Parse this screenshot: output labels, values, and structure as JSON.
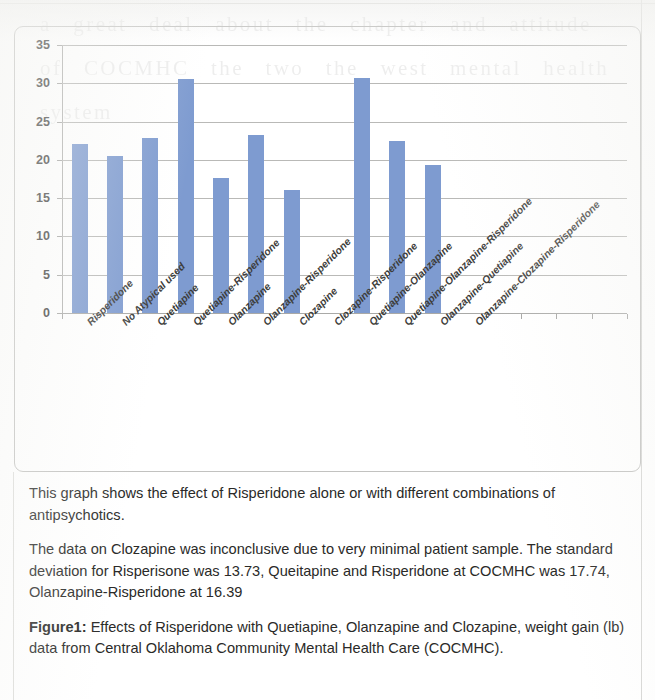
{
  "figure": {
    "frame_visible": true,
    "accent_color": "#7e9bd0",
    "grid_color": "#b9b9b7",
    "axis_color": "#a5a5a3"
  },
  "chart_data": {
    "type": "bar",
    "title": "",
    "xlabel": "",
    "ylabel": "",
    "ylim": [
      0,
      35
    ],
    "ytick_step": 5,
    "yticks": [
      0,
      5,
      10,
      15,
      20,
      25,
      30,
      35
    ],
    "grid": true,
    "legend": "none",
    "bar_color": "#7e9bd0",
    "total_category_slots": 16,
    "categories": [
      "Risperidone",
      "No Atypical used",
      "Quetiapine",
      "Quetiapine-Risperidone",
      "Olanzapine",
      "Olanzapine-Risperidone",
      "Clozapine",
      "Clozapine-Risperidone",
      "Quetiapine-Olanzapine",
      "Quetiapine-Olanzapine-Risperidone",
      "Olanzapine-Quetiapine",
      "Olanzapine-Clozapine-Risperidone"
    ],
    "values": [
      22.1,
      20.5,
      22.8,
      30.5,
      17.6,
      23.2,
      16.1,
      0,
      30.7,
      22.5,
      19.3,
      0
    ]
  },
  "caption": {
    "paragraph_1": "This graph shows the effect of Risperidone alone or with different combinations of antipsychotics.",
    "paragraph_2": "The data on Clozapine was inconclusive due to very minimal patient sample. The standard deviation for Risperisone was 13.73, Queitapine and Risperidone at COCMHC was 17.74, Olanzapine-Risperidone at 16.39",
    "figure_label": "Figure1:",
    "figure_text": " Effects of Risperidone with Quetiapine, Olanzapine and Clozapine, weight gain (lb) data from Central Oklahoma Community Mental Health Care (COCMHC)."
  },
  "bleed_through_text": "a great deal about the chapter and attitude of COCMHC the two the west mental health system"
}
